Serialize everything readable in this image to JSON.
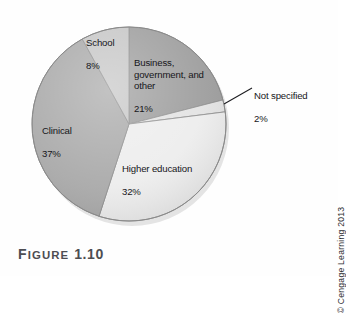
{
  "figure": {
    "caption_prefix": "F",
    "caption_word": "IGURE",
    "caption_number": "1.10"
  },
  "copyright": {
    "text": "© Cengage Learning 2013"
  },
  "labels": {
    "school": {
      "name": "School",
      "pct": "8%"
    },
    "business": {
      "name": "Business,\ngovernment, and\nother",
      "pct": "21%"
    },
    "not_specified": {
      "name": "Not specified",
      "pct": "2%"
    },
    "clinical": {
      "name": "Clinical",
      "pct": "37%"
    },
    "higher_ed": {
      "name": "Higher education",
      "pct": "32%"
    }
  },
  "chart_data": {
    "type": "pie",
    "xlabel": "",
    "ylabel": "",
    "units": "percent",
    "start_angle_deg": 0,
    "direction": "clockwise",
    "legend_position": "none",
    "grid": false,
    "categories": [
      "Business, government, and other",
      "Not specified",
      "Higher education",
      "Clinical",
      "School"
    ],
    "values": [
      21,
      2,
      32,
      37,
      8
    ],
    "slices": [
      {
        "label": "Business, government, and other",
        "value": 21,
        "color": "#9d9d9d",
        "start_deg": 0.0,
        "end_deg": 75.6,
        "label_text": "Business, government, and other 21%"
      },
      {
        "label": "Not specified",
        "value": 2,
        "color": "#e3e3e3",
        "start_deg": 75.6,
        "end_deg": 82.8,
        "label_text": "Not specified 2%",
        "callout": true
      },
      {
        "label": "Higher education",
        "value": 32,
        "color": "#ededed",
        "start_deg": 82.8,
        "end_deg": 198.0,
        "label_text": "Higher education 32%"
      },
      {
        "label": "Clinical",
        "value": 37,
        "color": "#a9a9a9",
        "start_deg": 198.0,
        "end_deg": 331.2,
        "label_text": "Clinical 37%"
      },
      {
        "label": "School",
        "value": 8,
        "color": "#c6c6c6",
        "start_deg": 331.2,
        "end_deg": 360.0,
        "label_text": "School 8%"
      }
    ],
    "colors": {
      "business": "#9d9d9d",
      "not_specified": "#e3e3e3",
      "higher_education": "#ededed",
      "clinical": "#a9a9a9",
      "school": "#c6c6c6",
      "outline": "#8a8a8a",
      "text": "#16161a",
      "caption": "#4d4d52"
    }
  }
}
